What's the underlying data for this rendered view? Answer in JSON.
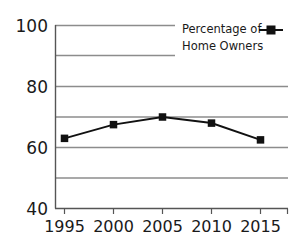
{
  "chart_data": {
    "type": "line",
    "title": "",
    "xlabel": "",
    "ylabel": "",
    "categories": [
      "1995",
      "2000",
      "2005",
      "2010",
      "2015"
    ],
    "x": [
      1995,
      2000,
      2005,
      2010,
      2015
    ],
    "series": [
      {
        "name": "Percentage of Home Owners",
        "values": [
          63,
          67.5,
          70,
          68,
          62.5
        ],
        "color": "#111111",
        "marker": "square"
      }
    ],
    "ylim": [
      40,
      100
    ],
    "xlim": [
      1992.5,
      2017.5
    ],
    "ytick_labels": [
      "100",
      "80",
      "60",
      "40"
    ],
    "ytick_values": [
      100,
      80,
      60,
      40
    ],
    "gridline_values": [
      100,
      90,
      80,
      70,
      60,
      50,
      40
    ],
    "grid": true,
    "grid_color": "#8c8c8c",
    "axis_color": "#555555",
    "legend": {
      "position": "top-right",
      "line1": "Percentage of",
      "line2": "Home Owners",
      "marker_icon": "line-square-marker"
    }
  }
}
